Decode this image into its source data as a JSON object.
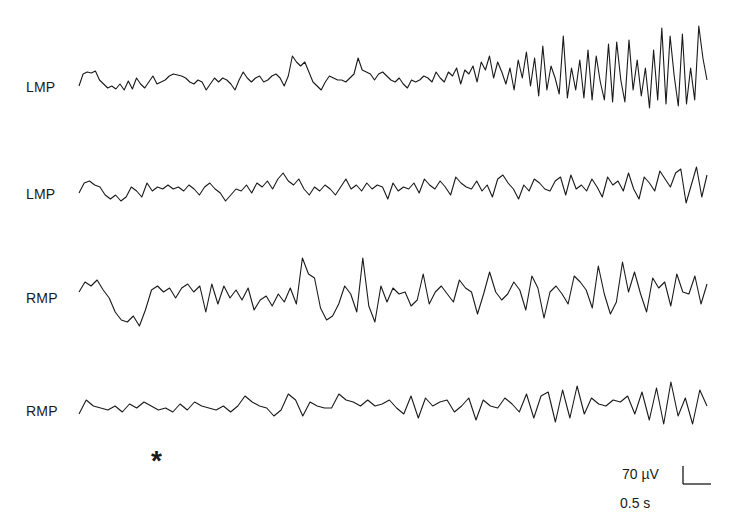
{
  "figure": {
    "channels": [
      {
        "label": "LMP",
        "baseline_y": 86
      },
      {
        "label": "LMP",
        "baseline_y": 193
      },
      {
        "label": "RMP",
        "baseline_y": 296
      },
      {
        "label": "RMP",
        "baseline_y": 410
      }
    ],
    "marker": "*",
    "scale_bar": {
      "amplitude_label": "70 µV",
      "time_label": "0.5 s"
    },
    "colors": {
      "trace": "#1a1a1a",
      "background": "#ffffff"
    }
  },
  "chart_data": {
    "type": "line",
    "title": "",
    "xlabel": "",
    "ylabel": "",
    "grid": false,
    "legend": "none",
    "annotations": [
      "*"
    ],
    "scale_bar": {
      "vertical": "70 µV",
      "horizontal": "0.5 s"
    },
    "x_range_px": [
      79,
      707
    ],
    "series": [
      {
        "name": "LMP (trace 1)",
        "values": [
          0,
          12,
          14,
          13,
          15,
          6,
          2,
          -2,
          0,
          -3,
          2,
          -4,
          5,
          -3,
          8,
          2,
          -2,
          4,
          10,
          2,
          4,
          6,
          10,
          12,
          11,
          10,
          8,
          4,
          2,
          6,
          4,
          -4,
          2,
          8,
          4,
          8,
          6,
          2,
          -4,
          6,
          14,
          8,
          4,
          8,
          10,
          4,
          6,
          10,
          12,
          8,
          0,
          10,
          30,
          24,
          20,
          24,
          14,
          4,
          0,
          -4,
          4,
          10,
          8,
          6,
          6,
          4,
          8,
          12,
          28,
          16,
          14,
          12,
          6,
          12,
          14,
          10,
          6,
          4,
          8,
          2,
          -2,
          6,
          4,
          6,
          10,
          8,
          4,
          14,
          8,
          4,
          14,
          10,
          18,
          2,
          16,
          12,
          20,
          4,
          24,
          16,
          30,
          8,
          24,
          14,
          2,
          18,
          -4,
          26,
          8,
          34,
          0,
          28,
          -10,
          40,
          -4,
          20,
          8,
          -8,
          50,
          -12,
          18,
          -4,
          26,
          -12,
          36,
          -14,
          30,
          4,
          -14,
          42,
          -16,
          44,
          6,
          -16,
          46,
          -4,
          26,
          -10,
          18,
          -22,
          36,
          -14,
          58,
          -18,
          50,
          10,
          -20,
          52,
          -18,
          18,
          -14,
          60,
          28,
          6
        ]
      },
      {
        "name": "LMP (trace 2)",
        "values": [
          0,
          10,
          12,
          8,
          6,
          -2,
          -6,
          -2,
          -8,
          -4,
          6,
          2,
          -4,
          10,
          2,
          6,
          4,
          8,
          4,
          6,
          2,
          8,
          4,
          -2,
          6,
          10,
          4,
          0,
          -8,
          -2,
          4,
          2,
          8,
          0,
          10,
          6,
          12,
          4,
          14,
          20,
          12,
          8,
          14,
          4,
          -2,
          6,
          2,
          8,
          4,
          -2,
          6,
          14,
          4,
          8,
          2,
          10,
          4,
          8,
          6,
          -6,
          10,
          2,
          6,
          4,
          10,
          0,
          14,
          8,
          4,
          12,
          6,
          -2,
          16,
          10,
          6,
          4,
          12,
          2,
          8,
          -4,
          14,
          18,
          10,
          4,
          -6,
          8,
          2,
          14,
          10,
          4,
          2,
          12,
          16,
          -2,
          18,
          4,
          8,
          2,
          14,
          6,
          -4,
          16,
          8,
          12,
          2,
          20,
          4,
          -6,
          16,
          10,
          2,
          22,
          14,
          6,
          20,
          24,
          -10,
          8,
          26,
          -4,
          18
        ]
      },
      {
        "name": "RMP (trace 3)",
        "values": [
          4,
          14,
          10,
          16,
          6,
          -2,
          -16,
          -24,
          -26,
          -20,
          -30,
          -14,
          6,
          10,
          4,
          8,
          -2,
          8,
          12,
          4,
          10,
          -16,
          12,
          -8,
          10,
          -2,
          6,
          -4,
          8,
          -14,
          -4,
          0,
          -10,
          2,
          -6,
          8,
          -8,
          38,
          22,
          18,
          -12,
          -24,
          -20,
          -8,
          10,
          2,
          -16,
          38,
          -10,
          -26,
          10,
          -6,
          8,
          2,
          4,
          -10,
          -4,
          22,
          -8,
          4,
          10,
          2,
          -6,
          16,
          8,
          4,
          -18,
          2,
          24,
          4,
          -4,
          2,
          14,
          6,
          -14,
          20,
          8,
          -22,
          4,
          10,
          2,
          -8,
          20,
          14,
          6,
          -12,
          30,
          2,
          -18,
          -6,
          34,
          4,
          24,
          2,
          -16,
          18,
          8,
          14,
          -10,
          22,
          4,
          2,
          20,
          -8,
          12
        ]
      },
      {
        "name": "RMP (trace 4)",
        "values": [
          -4,
          10,
          4,
          2,
          0,
          4,
          -2,
          6,
          2,
          8,
          4,
          0,
          2,
          -2,
          6,
          0,
          8,
          4,
          2,
          0,
          4,
          -2,
          4,
          14,
          8,
          4,
          2,
          -6,
          0,
          16,
          10,
          -6,
          8,
          4,
          2,
          2,
          16,
          10,
          8,
          4,
          10,
          4,
          6,
          10,
          2,
          -4,
          14,
          -8,
          12,
          4,
          8,
          10,
          -2,
          4,
          12,
          -10,
          10,
          4,
          2,
          12,
          6,
          -2,
          16,
          -8,
          14,
          18,
          -12,
          20,
          -8,
          24,
          -4,
          12,
          6,
          4,
          10,
          8,
          14,
          -4,
          18,
          -10,
          22,
          -14,
          28,
          -6,
          12,
          -14,
          20,
          4
        ]
      }
    ]
  }
}
